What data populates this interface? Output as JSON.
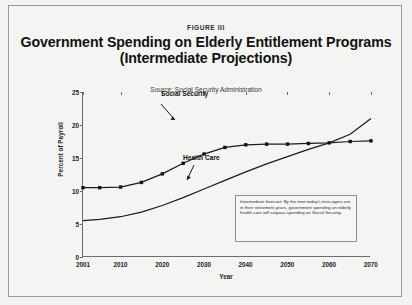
{
  "figure": {
    "label": "FIGURE III",
    "title_line1": "Government Spending on Elderly Entitlement Programs",
    "title_line2": "(Intermediate  Projections)",
    "source": "Source: Social Security Administration",
    "callout": "Intermediate forecast: By the time today's teen-agers are in their retirement years, government spending on elderly health care will surpass spending on Social Security."
  },
  "annotations": {
    "social_security": "Social Security",
    "health_care": "Health Care"
  },
  "chart_data": {
    "type": "line",
    "title": "Government Spending on Elderly Entitlement Programs (Intermediate Projections)",
    "subtitle": "Source: Social Security Administration",
    "xlabel": "Year",
    "ylabel": "Percent of Payroll",
    "xlim": [
      2001,
      2070
    ],
    "ylim": [
      0,
      25
    ],
    "yticks": [
      0,
      5,
      10,
      15,
      20,
      25
    ],
    "xticks": [
      2001,
      2010,
      2020,
      2030,
      2040,
      2050,
      2060,
      2070
    ],
    "grid": false,
    "legend": "inline-annotations",
    "series": [
      {
        "name": "Social Security",
        "markers": true,
        "x": [
          2001,
          2005,
          2010,
          2015,
          2020,
          2025,
          2030,
          2035,
          2040,
          2045,
          2050,
          2055,
          2060,
          2065,
          2070
        ],
        "values": [
          10.5,
          10.5,
          10.6,
          11.3,
          12.6,
          14.2,
          15.6,
          16.6,
          17.0,
          17.1,
          17.1,
          17.2,
          17.3,
          17.5,
          17.6
        ]
      },
      {
        "name": "Health Care",
        "markers": false,
        "x": [
          2001,
          2005,
          2010,
          2015,
          2020,
          2025,
          2030,
          2035,
          2040,
          2045,
          2050,
          2055,
          2060,
          2065,
          2070
        ],
        "values": [
          5.5,
          5.7,
          6.1,
          6.8,
          7.8,
          9.0,
          10.3,
          11.6,
          12.9,
          14.1,
          15.2,
          16.3,
          17.3,
          18.6,
          21.0
        ]
      }
    ],
    "crossover": {
      "year": 2063,
      "value": 17.4
    }
  }
}
